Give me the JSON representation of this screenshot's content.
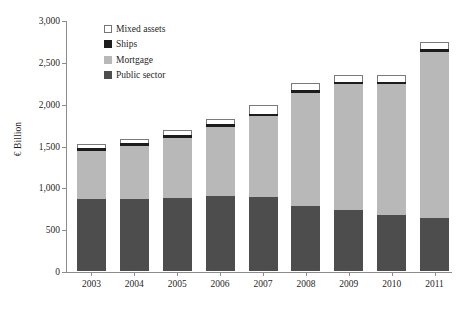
{
  "chart_data": {
    "type": "bar",
    "subtype": "stacked",
    "title": "",
    "xlabel": "",
    "ylabel": "€ Billion",
    "ylim": [
      0,
      3000
    ],
    "ytick_labels": [
      "0",
      "500",
      "1,000",
      "1,500",
      "2,000",
      "2,500",
      "3,000"
    ],
    "ytick_values": [
      0,
      500,
      1000,
      1500,
      2000,
      2500,
      3000
    ],
    "grid": false,
    "legend_position": "top-center-left",
    "categories": [
      "2003",
      "2004",
      "2005",
      "2006",
      "2007",
      "2008",
      "2009",
      "2010",
      "2011"
    ],
    "series": [
      {
        "name": "Public sector",
        "color": "#4d4d4d",
        "values": [
          860,
          865,
          870,
          895,
          880,
          777,
          730,
          672,
          628
        ]
      },
      {
        "name": "Mortgage",
        "color": "#b8b8b8",
        "values": [
          573,
          630,
          720,
          825,
          975,
          1345,
          1500,
          1560,
          1995
        ]
      },
      {
        "name": "Ships",
        "color": "#1c1c1c",
        "values": [
          36,
          35,
          35,
          36,
          24,
          36,
          24,
          24,
          36
        ]
      },
      {
        "name": "Mixed assets",
        "color": "#ffffff",
        "values": [
          48,
          50,
          60,
          60,
          108,
          84,
          84,
          84,
          84
        ]
      }
    ],
    "totals": [
      1517,
      1580,
      1685,
      1816,
      1987,
      2242,
      2338,
      2340,
      2743
    ]
  },
  "legend": {
    "items": [
      {
        "label": "Mixed assets",
        "swatch": "mixed-assets-swatch"
      },
      {
        "label": "Ships",
        "swatch": "ships-swatch"
      },
      {
        "label": "Mortgage",
        "swatch": "mortgage-swatch"
      },
      {
        "label": "Public sector",
        "swatch": "public-sector-swatch"
      }
    ]
  }
}
